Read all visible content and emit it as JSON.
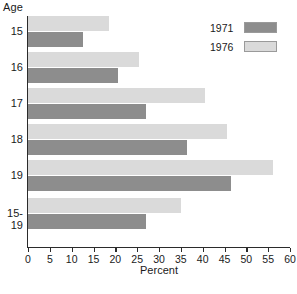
{
  "chart_data": {
    "type": "bar",
    "orientation": "horizontal",
    "title": "",
    "xlabel": "Percent",
    "ylabel": "Age",
    "xlim": [
      0,
      60
    ],
    "xticks": [
      0,
      5,
      10,
      15,
      20,
      25,
      30,
      35,
      40,
      45,
      50,
      55,
      60
    ],
    "grid": false,
    "legend_position": "top-right",
    "categories": [
      "15",
      "16",
      "17",
      "18",
      "19",
      "15-\n19"
    ],
    "category_labels_display": [
      "15",
      "16",
      "17",
      "18",
      "19",
      "15-|19"
    ],
    "series": [
      {
        "name": "1971",
        "color": "#8d8d8d",
        "values": [
          12.5,
          20.5,
          27.0,
          36.5,
          46.5,
          27.0
        ]
      },
      {
        "name": "1976",
        "color": "#dadada",
        "values": [
          18.5,
          25.5,
          40.5,
          45.5,
          56.0,
          35.0
        ]
      }
    ]
  },
  "axes": {
    "y_axis_title": "Age",
    "x_axis_title": "Percent",
    "x_tick_labels": [
      "0",
      "5",
      "10",
      "15",
      "20",
      "25",
      "30",
      "35",
      "40",
      "45",
      "50",
      "55",
      "60"
    ],
    "y_category_labels": [
      {
        "line1": "15",
        "line2": ""
      },
      {
        "line1": "16",
        "line2": ""
      },
      {
        "line1": "17",
        "line2": ""
      },
      {
        "line1": "18",
        "line2": ""
      },
      {
        "line1": "19",
        "line2": ""
      },
      {
        "line1": "15-",
        "line2": "19"
      }
    ]
  },
  "legend": {
    "entries": [
      {
        "label": "1971",
        "color": "#8d8d8d"
      },
      {
        "label": "1976",
        "color": "#dadada"
      }
    ]
  },
  "caption": {
    "text": ""
  },
  "colors": {
    "series_1971": "#8d8d8d",
    "series_1976": "#dadada",
    "axis": "#2b2b2b",
    "background": "#ffffff"
  }
}
